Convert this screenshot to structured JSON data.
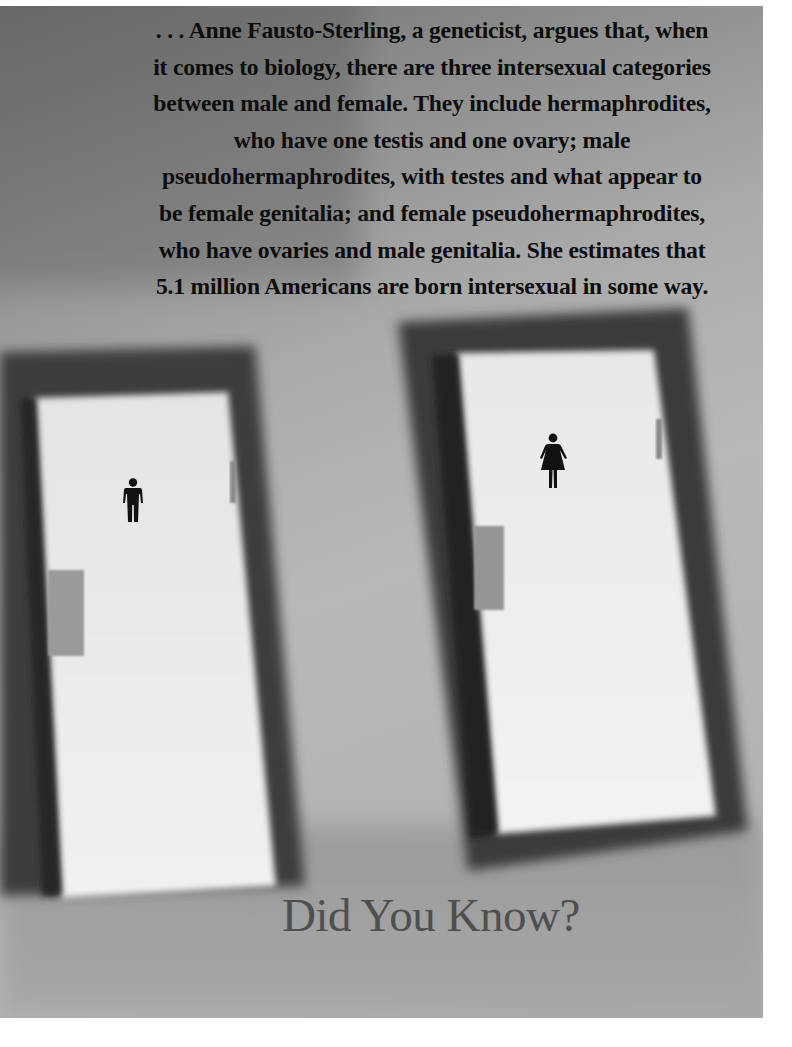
{
  "page": {
    "quote_lines": [
      ". . . Anne Fausto-Sterling, a geneticist, argues that, when",
      "it comes to biology, there are three intersexual categories",
      "between male and female. They include hermaphrodites,",
      "who have one testis and one ovary; male",
      "pseudohermaphrodites, with testes and what appear to",
      "be female genitalia; and female pseudohermaphrodites,",
      "who have ovaries and male genitalia. She estimates that",
      "5.1 million Americans are born intersexual in some way."
    ],
    "heading": "Did You Know?"
  },
  "image": {
    "subject": "two restroom doors",
    "left_door_icon": "male-restroom-icon",
    "right_door_icon": "female-restroom-icon"
  },
  "colors": {
    "text": "#0d0d0d",
    "heading": "#4f4f4f",
    "door_frame": "#3c3c3c",
    "door_panel": "#ececec",
    "wall": "#b5b5b5"
  }
}
